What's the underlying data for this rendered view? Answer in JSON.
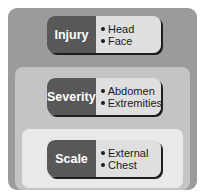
{
  "diagram": {
    "type": "nested-layers",
    "colors": {
      "outer_layer": "#9b9b9b",
      "middle_layer": "#c4c4c4",
      "inner_layer": "#e9e9e9",
      "label_block": "#585858",
      "items_panel": "#dfdfdf",
      "shadow": "#1e1e1e"
    },
    "layers": [
      {
        "label": "Injury",
        "items": [
          "Head",
          "Face"
        ]
      },
      {
        "label": "Severity",
        "items": [
          "Abdomen",
          "Extremities"
        ]
      },
      {
        "label": "Scale",
        "items": [
          "External",
          "Chest"
        ]
      }
    ]
  }
}
